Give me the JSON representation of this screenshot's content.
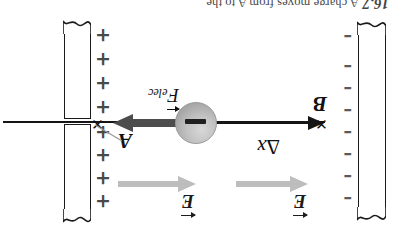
{
  "figure": {
    "title_fragment": "16.7  A charge moves from A to B",
    "orientation_note": "180-degree-rotated-scan",
    "background_color": "#ffffff",
    "ink_color": "#151515"
  },
  "caption": {
    "number": "16.7",
    "text": "A charge moves from A to the"
  },
  "plates": {
    "left": {
      "name": "negative-plate",
      "sign_symbol": "–",
      "sign_count": 8,
      "signs": [
        "–",
        "–",
        "–",
        "–",
        "–",
        "–",
        "–",
        "–"
      ],
      "sign_color": "#5a5a5a"
    },
    "right": {
      "name": "positive-plate",
      "sign_symbol": "+",
      "sign_count": 8,
      "signs": [
        "+",
        "+",
        "+",
        "+",
        "+",
        "+",
        "+",
        "+"
      ],
      "sign_color": "#4a4a4a"
    }
  },
  "field_arrows": [
    {
      "label": "E",
      "direction": "left",
      "color": "#bdbdbd"
    },
    {
      "label": "E",
      "direction": "left",
      "color": "#bdbdbd"
    }
  ],
  "charge": {
    "label": "–",
    "polarity": "negative",
    "fill_color": "#b0b0b0"
  },
  "points": {
    "a": {
      "label": "A",
      "marker": "✕"
    },
    "b": {
      "label": "B",
      "marker": "✕"
    }
  },
  "displacement": {
    "symbol": "Δ",
    "variable": "x",
    "direction": "left"
  },
  "force": {
    "symbol": "F",
    "subscript": "elec",
    "direction": "right",
    "color": "#4d4d4d"
  }
}
